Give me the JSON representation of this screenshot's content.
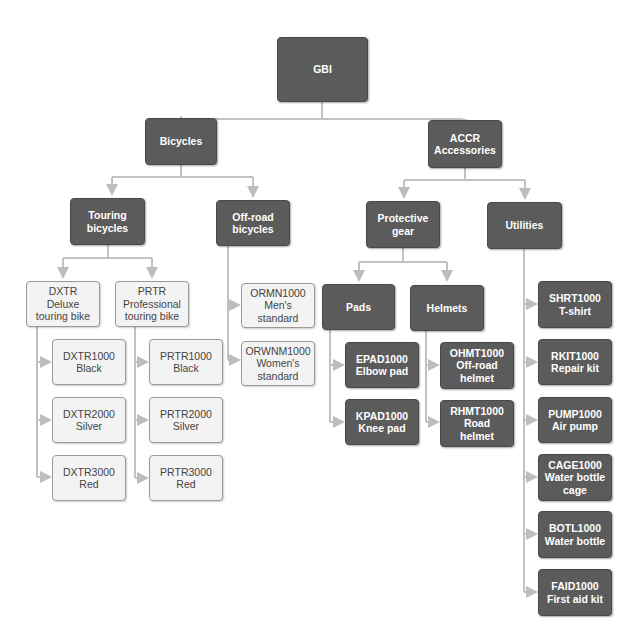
{
  "diagram": {
    "colors": {
      "dark_box": "#5b5b5b",
      "light_box": "#f3f3f3",
      "connector": "#bdbdbd"
    },
    "nodes": {
      "gbi": {
        "l1": "GBI",
        "l2": "",
        "l3": ""
      },
      "bicycles": {
        "l1": "Bicycles",
        "l2": "",
        "l3": ""
      },
      "accr": {
        "l1": "ACCR",
        "l2": "Accessories",
        "l3": ""
      },
      "touring": {
        "l1": "Touring",
        "l2": "bicycles",
        "l3": ""
      },
      "offroad": {
        "l1": "Off-road",
        "l2": "bicycles",
        "l3": ""
      },
      "dxtr": {
        "l1": "DXTR",
        "l2": "Deluxe",
        "l3": "touring bike"
      },
      "prtr": {
        "l1": "PRTR",
        "l2": "Professional",
        "l3": "touring bike"
      },
      "dxtr1000": {
        "l1": "DXTR1000",
        "l2": "Black",
        "l3": ""
      },
      "dxtr2000": {
        "l1": "DXTR2000",
        "l2": "Silver",
        "l3": ""
      },
      "dxtr3000": {
        "l1": "DXTR3000",
        "l2": "Red",
        "l3": ""
      },
      "prtr1000": {
        "l1": "PRTR1000",
        "l2": "Black",
        "l3": ""
      },
      "prtr2000": {
        "l1": "PRTR2000",
        "l2": "Silver",
        "l3": ""
      },
      "prtr3000": {
        "l1": "PRTR3000",
        "l2": "Red",
        "l3": ""
      },
      "ormn1000": {
        "l1": "ORMN1000",
        "l2": "Men's",
        "l3": "standard"
      },
      "orwnm1000": {
        "l1": "ORWNM1000",
        "l2": "Women's",
        "l3": "standard"
      },
      "protective": {
        "l1": "Protective",
        "l2": "gear",
        "l3": ""
      },
      "utilities": {
        "l1": "Utilities",
        "l2": "",
        "l3": ""
      },
      "pads": {
        "l1": "Pads",
        "l2": "",
        "l3": ""
      },
      "helmets": {
        "l1": "Helmets",
        "l2": "",
        "l3": ""
      },
      "epad1000": {
        "l1": "EPAD1000",
        "l2": "Elbow pad",
        "l3": ""
      },
      "kpad1000": {
        "l1": "KPAD1000",
        "l2": "Knee pad",
        "l3": ""
      },
      "ohmt1000": {
        "l1": "OHMT1000",
        "l2": "Off-road",
        "l3": "helmet"
      },
      "rhmt1000": {
        "l1": "RHMT1000",
        "l2": "Road",
        "l3": "helmet"
      },
      "shrt1000": {
        "l1": "SHRT1000",
        "l2": "T-shirt",
        "l3": ""
      },
      "rkit1000": {
        "l1": "RKIT1000",
        "l2": "Repair kit",
        "l3": ""
      },
      "pump1000": {
        "l1": "PUMP1000",
        "l2": "Air pump",
        "l3": ""
      },
      "cage1000": {
        "l1": "CAGE1000",
        "l2": "Water bottle",
        "l3": "cage"
      },
      "botl1000": {
        "l1": "BOTL1000",
        "l2": "Water bottle",
        "l3": ""
      },
      "faid1000": {
        "l1": "FAID1000",
        "l2": "First aid kit",
        "l3": ""
      }
    }
  }
}
